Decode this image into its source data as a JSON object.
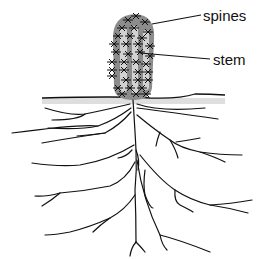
{
  "diagram": {
    "labels": {
      "spines": "spines",
      "stem": "stem"
    },
    "colors": {
      "background": "#ffffff",
      "stem_body": "#8c8c8c",
      "stem_ribs": "#d2d2d2",
      "ground_shade": "#cfcfcf",
      "lines": "#111111"
    }
  }
}
